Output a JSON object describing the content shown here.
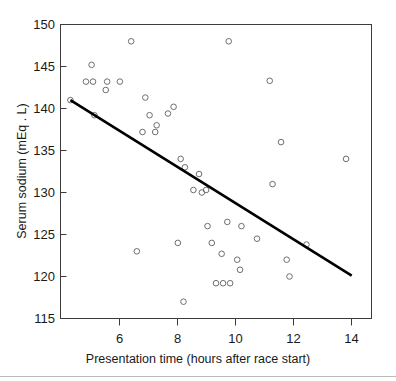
{
  "chart_data": {
    "type": "scatter",
    "title": "",
    "xlabel": "Presentation time (hours after race start)",
    "ylabel": "Serum sodium (mEq . L)",
    "xlim": [
      4.1,
      15.1
    ],
    "ylim": [
      115,
      150
    ],
    "xticks": [
      6,
      8,
      10,
      12,
      14
    ],
    "xtick_labels": [
      "6",
      "8",
      "10",
      "12",
      "14"
    ],
    "yticks": [
      115,
      120,
      125,
      130,
      135,
      140,
      145,
      150
    ],
    "ytick_labels": [
      "115",
      "120",
      "125",
      "130",
      "135",
      "140",
      "145",
      "150"
    ],
    "grid": false,
    "legend": false,
    "marker": "open-circle",
    "marker_color": "#6e6e72",
    "series": [
      {
        "name": "Runners",
        "points": [
          [
            4.45,
            141.0
          ],
          [
            5.0,
            143.2
          ],
          [
            5.2,
            145.2
          ],
          [
            5.25,
            143.2
          ],
          [
            5.3,
            139.2
          ],
          [
            5.7,
            142.2
          ],
          [
            5.75,
            143.2
          ],
          [
            6.2,
            143.2
          ],
          [
            6.6,
            148.0
          ],
          [
            6.8,
            123.0
          ],
          [
            7.0,
            137.2
          ],
          [
            7.1,
            141.3
          ],
          [
            7.25,
            139.2
          ],
          [
            7.45,
            137.2
          ],
          [
            7.5,
            138.0
          ],
          [
            7.9,
            139.4
          ],
          [
            8.1,
            140.2
          ],
          [
            8.25,
            124.0
          ],
          [
            8.35,
            134.0
          ],
          [
            8.45,
            117.0
          ],
          [
            8.5,
            133.0
          ],
          [
            8.8,
            130.3
          ],
          [
            9.0,
            132.2
          ],
          [
            9.1,
            130.0
          ],
          [
            9.25,
            130.3
          ],
          [
            9.3,
            126.0
          ],
          [
            9.45,
            124.0
          ],
          [
            9.6,
            119.2
          ],
          [
            9.8,
            122.7
          ],
          [
            9.85,
            119.2
          ],
          [
            10.0,
            126.5
          ],
          [
            10.05,
            148.0
          ],
          [
            10.1,
            119.2
          ],
          [
            10.35,
            122.0
          ],
          [
            10.45,
            120.8
          ],
          [
            10.5,
            126.0
          ],
          [
            11.05,
            124.5
          ],
          [
            11.5,
            143.3
          ],
          [
            11.6,
            131.0
          ],
          [
            11.9,
            136.0
          ],
          [
            12.1,
            122.0
          ],
          [
            12.2,
            120.0
          ],
          [
            12.8,
            123.8
          ],
          [
            14.2,
            134.0
          ]
        ]
      }
    ],
    "fit_line": {
      "name": "Linear regression fit",
      "x": [
        4.45,
        14.4
      ],
      "y": [
        141.0,
        120.1
      ]
    }
  }
}
